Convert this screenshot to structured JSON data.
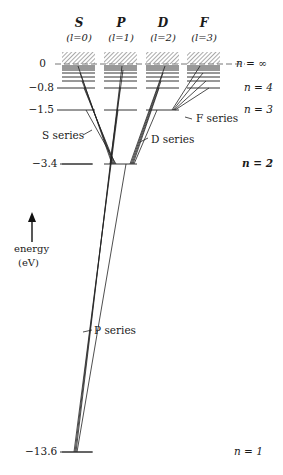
{
  "diagram": {
    "type": "energy-level (Grotrian) diagram",
    "columns": [
      {
        "letter": "S",
        "l_label": "(l=0)"
      },
      {
        "letter": "P",
        "l_label": "(l=1)"
      },
      {
        "letter": "D",
        "l_label": "(l=2)"
      },
      {
        "letter": "F",
        "l_label": "(l=3)"
      }
    ],
    "energy_ticks": [
      "0",
      "−0.8",
      "−1.5",
      "−3.4",
      "−13.6"
    ],
    "n_labels": {
      "inf": "n = ∞",
      "n4": "n = 4",
      "n3": "n = 3",
      "n2": "n = 2",
      "n1": "n = 1"
    },
    "series_labels": {
      "s": "S series",
      "p": "P series",
      "d": "D series",
      "f": "F series"
    },
    "axis": {
      "label": "energy",
      "unit": "(eV)"
    },
    "levels_eV": {
      "n1": -13.6,
      "n2": -3.4,
      "n3": -1.5,
      "n4": -0.85,
      "n_inf": 0
    }
  }
}
